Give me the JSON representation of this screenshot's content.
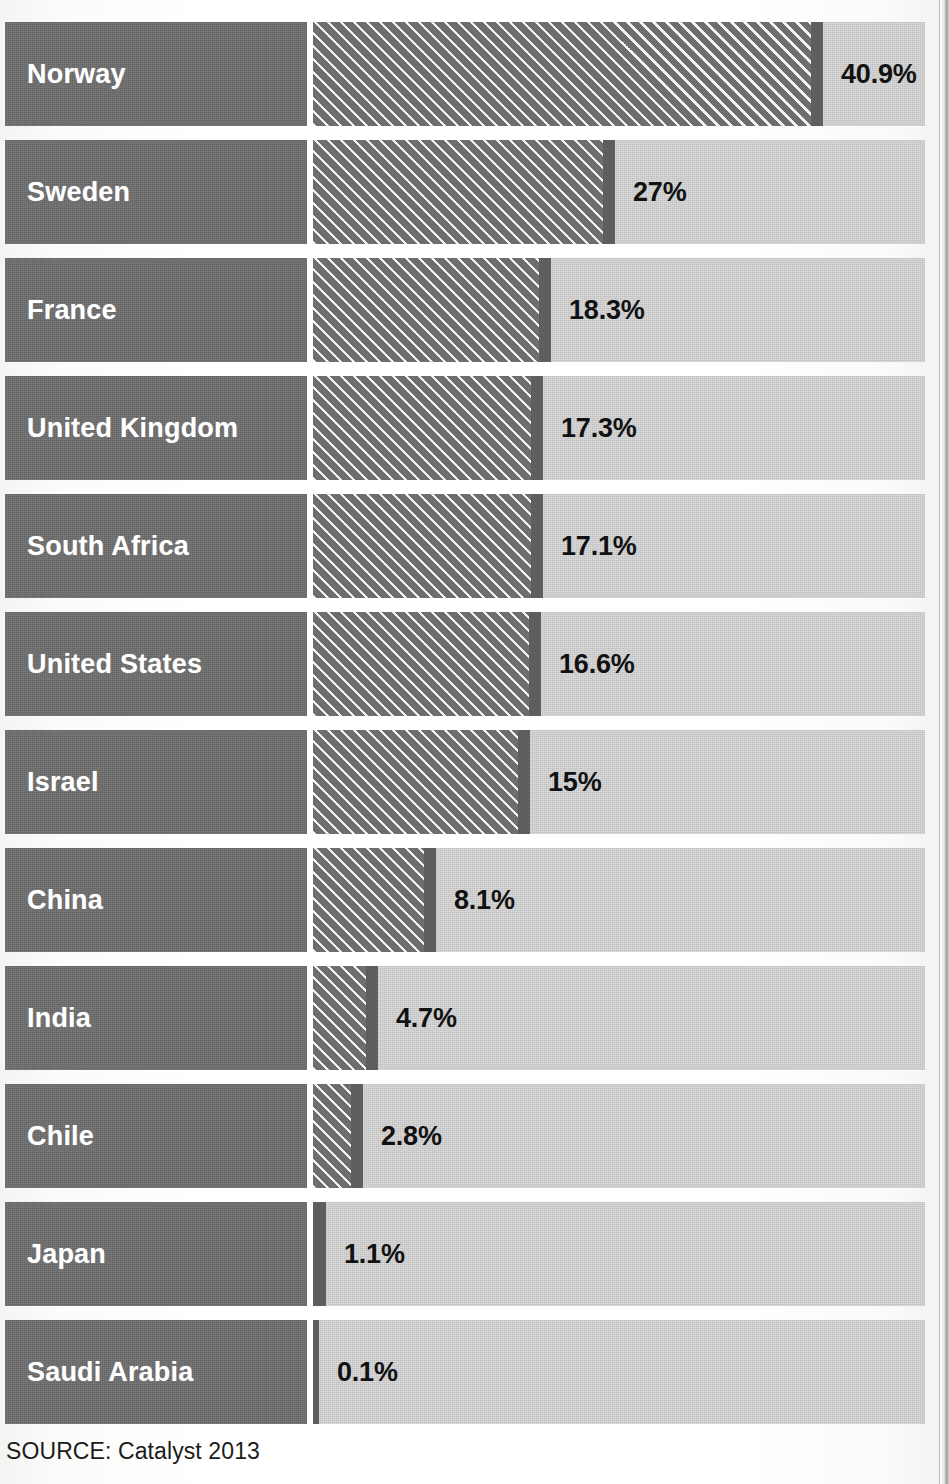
{
  "source_note": "SOURCE: Catalyst 2013",
  "colors": {
    "label_block": "#6e6e6e",
    "bar_fill": "#6e6e6e",
    "bar_cap": "#5e5e5e",
    "track": "#cfcfcf",
    "label_text": "#ffffff",
    "value_text": "#111111",
    "page_background": "#ffffff"
  },
  "chart_data": {
    "type": "bar",
    "orientation": "horizontal",
    "title": "",
    "subtitle": "",
    "xlabel": "",
    "ylabel": "",
    "unit": "%",
    "grid": false,
    "legend": false,
    "axis_visible": false,
    "xlim": [
      0,
      50
    ],
    "categories": [
      "Norway",
      "Sweden",
      "France",
      "United Kingdom",
      "South Africa",
      "United States",
      "Israel",
      "China",
      "India",
      "Chile",
      "Japan",
      "Saudi Arabia"
    ],
    "values": [
      40.9,
      27,
      18.3,
      17.3,
      17.1,
      16.6,
      15,
      8.1,
      4.7,
      2.8,
      1.1,
      0.1
    ],
    "value_labels": [
      "40.9%",
      "27%",
      "18.3%",
      "17.3%",
      "17.1%",
      "16.6%",
      "15%",
      "8.1%",
      "4.7%",
      "2.8%",
      "1.1%",
      "0.1%"
    ],
    "source": "SOURCE: Catalyst 2013"
  },
  "rows": [
    {
      "label": "Norway",
      "value": 40.9,
      "value_label": "40.9%",
      "bar_px": 510,
      "tiny": false
    },
    {
      "label": "Sweden",
      "value": 27,
      "value_label": "27%",
      "bar_px": 302,
      "tiny": false
    },
    {
      "label": "France",
      "value": 18.3,
      "value_label": "18.3%",
      "bar_px": 238,
      "tiny": false
    },
    {
      "label": "United Kingdom",
      "value": 17.3,
      "value_label": "17.3%",
      "bar_px": 230,
      "tiny": false
    },
    {
      "label": "South Africa",
      "value": 17.1,
      "value_label": "17.1%",
      "bar_px": 230,
      "tiny": false
    },
    {
      "label": "United States",
      "value": 16.6,
      "value_label": "16.6%",
      "bar_px": 228,
      "tiny": false
    },
    {
      "label": "Israel",
      "value": 15,
      "value_label": "15%",
      "bar_px": 217,
      "tiny": false
    },
    {
      "label": "China",
      "value": 8.1,
      "value_label": "8.1%",
      "bar_px": 123,
      "tiny": false
    },
    {
      "label": "India",
      "value": 4.7,
      "value_label": "4.7%",
      "bar_px": 65,
      "tiny": false
    },
    {
      "label": "Chile",
      "value": 2.8,
      "value_label": "2.8%",
      "bar_px": 50,
      "tiny": false
    },
    {
      "label": "Japan",
      "value": 1.1,
      "value_label": "1.1%",
      "bar_px": 13,
      "tiny": true
    },
    {
      "label": "Saudi Arabia",
      "value": 0.1,
      "value_label": "0.1%",
      "bar_px": 6,
      "tiny": true
    }
  ],
  "layout": {
    "row_top_start": 22,
    "row_pitch": 118,
    "row_height": 104
  }
}
